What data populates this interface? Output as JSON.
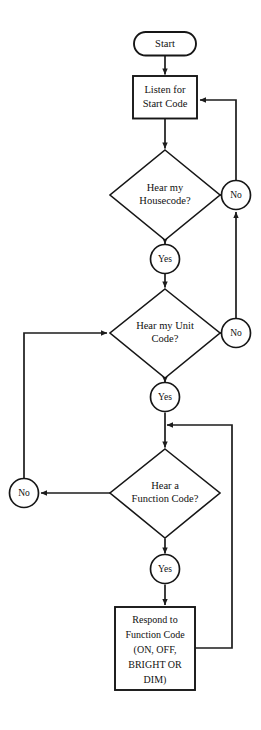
{
  "diagram": {
    "type": "flowchart",
    "background_color": "#ffffff",
    "line_color": "#1c1c1c",
    "text_color": "#111111",
    "shape_fill": "#ffffff"
  },
  "nodes": {
    "start": {
      "label": "Start",
      "shape": "terminator"
    },
    "listen": {
      "shape": "process",
      "line1": "Listen for",
      "line2": "Start Code"
    },
    "housecode": {
      "shape": "decision",
      "line1": "Hear my",
      "line2": "Housecode?"
    },
    "unitcode": {
      "shape": "decision",
      "line1": "Hear my Unit",
      "line2": "Code?"
    },
    "functioncode": {
      "shape": "decision",
      "line1": "Hear a",
      "line2": "Function Code?"
    },
    "respond": {
      "shape": "process",
      "line1": "Respond to",
      "line2": "Function Code",
      "line3": "(ON, OFF,",
      "line4": "BRIGHT OR",
      "line5": "DIM)"
    }
  },
  "connectors": {
    "yes_housecode": "Yes",
    "no_housecode": "No",
    "yes_unitcode": "Yes",
    "no_unitcode": "No",
    "yes_functioncode": "Yes",
    "no_functioncode": "No"
  },
  "flow_edges": [
    {
      "from": "start",
      "to": "listen",
      "label": ""
    },
    {
      "from": "listen",
      "to": "housecode",
      "label": ""
    },
    {
      "from": "housecode",
      "to": "yes_housecode",
      "label": "Yes"
    },
    {
      "from": "housecode",
      "to": "no_housecode",
      "label": "No"
    },
    {
      "from": "no_housecode",
      "to": "listen",
      "label": ""
    },
    {
      "from": "yes_housecode",
      "to": "unitcode",
      "label": ""
    },
    {
      "from": "unitcode",
      "to": "yes_unitcode",
      "label": "Yes"
    },
    {
      "from": "unitcode",
      "to": "no_unitcode",
      "label": "No"
    },
    {
      "from": "no_unitcode",
      "to": "no_housecode",
      "label": ""
    },
    {
      "from": "yes_unitcode",
      "to": "functioncode",
      "label": ""
    },
    {
      "from": "functioncode",
      "to": "no_functioncode",
      "label": "No"
    },
    {
      "from": "no_functioncode",
      "to": "unitcode",
      "label": ""
    },
    {
      "from": "functioncode",
      "to": "yes_functioncode",
      "label": "Yes"
    },
    {
      "from": "yes_functioncode",
      "to": "respond",
      "label": ""
    },
    {
      "from": "respond",
      "to": "functioncode",
      "label": ""
    }
  ]
}
